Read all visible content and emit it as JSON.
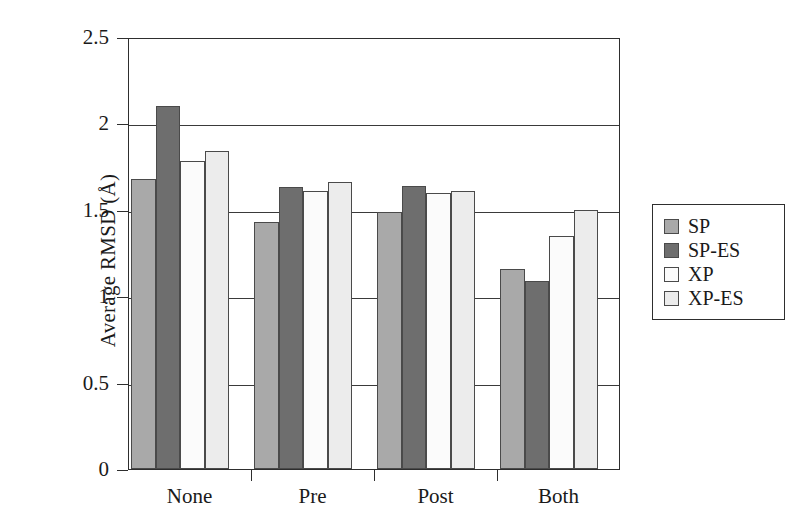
{
  "chart_data": {
    "type": "bar",
    "title": "",
    "xlabel": "",
    "ylabel": "Average RMSD (Å)",
    "categories": [
      "None",
      "Pre",
      "Post",
      "Both"
    ],
    "series": [
      {
        "name": "SP",
        "color": "#a9a9a9",
        "values": [
          1.68,
          1.43,
          1.49,
          1.16
        ]
      },
      {
        "name": "SP-ES",
        "color": "#6e6e6e",
        "values": [
          2.1,
          1.63,
          1.64,
          1.09
        ]
      },
      {
        "name": "XP",
        "color": "#fbfbfb",
        "values": [
          1.78,
          1.61,
          1.6,
          1.35
        ]
      },
      {
        "name": "XP-ES",
        "color": "#ececec",
        "values": [
          1.84,
          1.66,
          1.61,
          1.5
        ]
      }
    ],
    "ylim": [
      0,
      2.5
    ],
    "y_ticks": [
      0,
      0.5,
      1,
      1.5,
      2,
      2.5
    ],
    "y_tick_labels": [
      "0",
      "0.5",
      "1",
      "1.5",
      "2",
      "2.5"
    ],
    "grid": true,
    "grid_axis": "y",
    "legend_position": "right-outside",
    "legend_entries": [
      "SP",
      "SP-ES",
      "XP",
      "XP-ES"
    ]
  },
  "colors": {
    "axis": "#2e2e2e",
    "grid": "#3a3a3a",
    "bar_outline": "#4a4a4a",
    "background": "#ffffff"
  }
}
